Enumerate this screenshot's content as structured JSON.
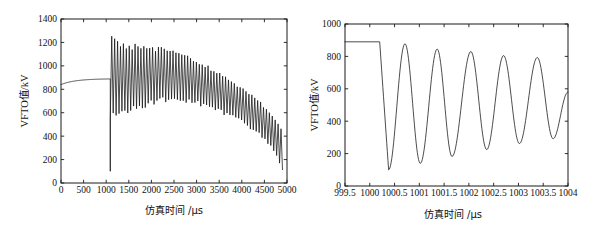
{
  "figure": {
    "background": "#ffffff",
    "line_color": "#111111",
    "axis_color": "#1a1a1a"
  },
  "chart_data": [
    {
      "id": "left",
      "type": "line",
      "title": "",
      "xlabel": "仿真时间 /μs",
      "ylabel": "VFTO值/kV",
      "xlim": [
        0,
        5000
      ],
      "ylim": [
        0,
        1400
      ],
      "xticks": [
        0,
        500,
        1000,
        1500,
        2000,
        2500,
        3000,
        3500,
        4000,
        4500,
        5000
      ],
      "xticklabels": [
        "0",
        "500",
        "1000",
        "1500",
        "2000",
        "2500",
        "3000",
        "3500",
        "4000",
        "4500",
        "5000"
      ],
      "yticks": [
        0,
        200,
        400,
        600,
        800,
        1000,
        1200,
        1400
      ],
      "yticklabels": [
        "0",
        "200",
        "400",
        "600",
        "800",
        "1000",
        "1200",
        "1400"
      ],
      "grid": false,
      "legend": "none",
      "description": "VFTO waveform: smooth pre-strike rise from 840 kV to 890 kV until 1090 us, then a vertical collapse to ~100 kV followed by a high-frequency damped oscillation whose envelope decays from 1270/520 kV down to 470/110 kV at 4900 us.",
      "series": [
        {
          "name": "VFTO",
          "prestrike": {
            "x_start": 0,
            "x_end": 1090,
            "y_start": 840,
            "y_end": 890,
            "shape": "saturating-rise"
          },
          "strike_time": 1090,
          "strike_drop_to": 100,
          "oscillation": {
            "x_start": 1090,
            "x_end": 4900,
            "frequency_mhz_equiv": 0.0155,
            "cycles": 59,
            "envelope_x": [
              1090,
              1200,
              1400,
              1700,
              2000,
              2300,
              2600,
              2900,
              3200,
              3500,
              3800,
              4100,
              4400,
              4700,
              4900
            ],
            "envelope_upper": [
              1270,
              1250,
              1210,
              1185,
              1175,
              1165,
              1125,
              1075,
              1015,
              950,
              880,
              800,
              710,
              560,
              470
            ],
            "envelope_lower": [
              520,
              540,
              570,
              620,
              660,
              690,
              690,
              670,
              640,
              600,
              545,
              480,
              400,
              260,
              110
            ]
          }
        }
      ]
    },
    {
      "id": "right",
      "type": "line",
      "title": "",
      "xlabel": "仿真时间 /μs",
      "ylabel": "VFTO值/kV",
      "xlim": [
        999.5,
        1004
      ],
      "ylim": [
        0,
        1000
      ],
      "xticks": [
        999.5,
        1000,
        1000.5,
        1001,
        1001.5,
        1002,
        1002.5,
        1003,
        1003.5,
        1004
      ],
      "xticklabels": [
        "999.5",
        "1000",
        "1000.5",
        "1001",
        "1001.5",
        "1002",
        "1002.5",
        "1003",
        "1003.5",
        "1004"
      ],
      "yticks": [
        0,
        200,
        400,
        600,
        800,
        1000
      ],
      "yticklabels": [
        "0",
        "200",
        "400",
        "600",
        "800",
        "1000"
      ],
      "grid": false,
      "legend": "none",
      "description": "Zoomed view of the VFTO strike: flat 890 kV plateau until 1000.2 us, then a steep drop to 100 kV and a damped oscillation of about 1.45 MHz with slowly decaying peaks.",
      "series": [
        {
          "name": "VFTO",
          "plateau": {
            "x_start": 999.5,
            "x_end": 1000.2,
            "y": 890
          },
          "drop": {
            "x_from": 1000.2,
            "x_to": 1000.38,
            "y_to": 100
          },
          "extrema_x": [
            1000.38,
            1000.71,
            1001.02,
            1001.36,
            1001.66,
            1002.04,
            1002.36,
            1002.7,
            1003.02,
            1003.38,
            1003.7,
            1004.0
          ],
          "extrema_y": [
            100,
            878,
            140,
            845,
            182,
            830,
            225,
            805,
            262,
            793,
            292,
            580
          ],
          "extrema_kind": [
            "min",
            "max",
            "min",
            "max",
            "min",
            "max",
            "min",
            "max",
            "min",
            "max",
            "min",
            "end"
          ]
        }
      ]
    }
  ]
}
